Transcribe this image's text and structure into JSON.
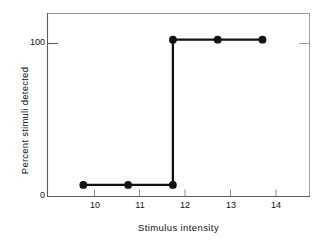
{
  "chart_data": {
    "type": "line",
    "title": "",
    "subtitle": "",
    "xlabel": "Stimulus intensity",
    "ylabel": "Percent stimuli detected",
    "x": [
      10,
      11,
      12,
      12,
      13,
      14
    ],
    "values": [
      0,
      0,
      0,
      100,
      100,
      100
    ],
    "series": [
      {
        "name": "",
        "x": [
          10,
          11,
          12,
          12,
          13,
          14
        ],
        "values": [
          0,
          0,
          0,
          100,
          100,
          100
        ]
      }
    ],
    "markers": [
      {
        "x": 10,
        "y": 0
      },
      {
        "x": 11,
        "y": 0
      },
      {
        "x": 12,
        "y": 0
      },
      {
        "x": 12,
        "y": 100
      },
      {
        "x": 13,
        "y": 100
      },
      {
        "x": 14,
        "y": 100
      }
    ],
    "xlim": [
      9.2,
      15.05
    ],
    "ylim": [
      -8,
      118
    ],
    "xticks": [
      10,
      11,
      12,
      13,
      14
    ],
    "xtick_labels": [
      "10",
      "11",
      "12",
      "13",
      "14"
    ],
    "yticks": [
      0,
      100
    ],
    "ytick_labels": [
      "0",
      "100"
    ],
    "grid": false,
    "legend": null,
    "legend_position": "none",
    "annotations": [],
    "colors": {
      "background": "#ffffff",
      "line": "#111111",
      "marker": "#111111",
      "axis": "#555555",
      "frame": "#9a9a9a",
      "text": "#111111"
    }
  }
}
